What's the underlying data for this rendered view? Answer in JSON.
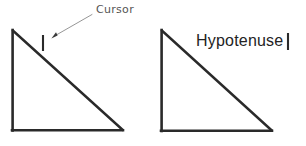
{
  "canvas": {
    "width": 306,
    "height": 146,
    "background_color": "#ffffff",
    "stroke_color": "#2a2a2a",
    "annotation_color": "#6e6e6e",
    "text_color": "#232323"
  },
  "figures": {
    "left_triangle": {
      "name": "right-triangle-with-cursor",
      "apex": [
        12,
        30
      ],
      "bottom_left": [
        12,
        131
      ],
      "bottom_right": [
        123,
        130
      ],
      "stroke_width": 2.6
    },
    "right_triangle": {
      "name": "right-triangle-with-hypotenuse-label",
      "apex": [
        161,
        30
      ],
      "bottom_left": [
        161,
        131
      ],
      "bottom_right": [
        272,
        131
      ],
      "stroke_width": 2.6
    }
  },
  "annotations": {
    "cursor_label": "Cursor",
    "cursor_caret": {
      "x": 43,
      "y_top": 35,
      "y_bottom": 51,
      "width": 2
    },
    "arrow": {
      "from": [
        92,
        15
      ],
      "to": [
        52,
        38
      ],
      "head_size": 4
    },
    "hypotenuse_label": "Hypotenuse",
    "hypotenuse_caret": {
      "x": 288,
      "y_top": 33,
      "y_bottom": 50,
      "width": 2
    }
  }
}
